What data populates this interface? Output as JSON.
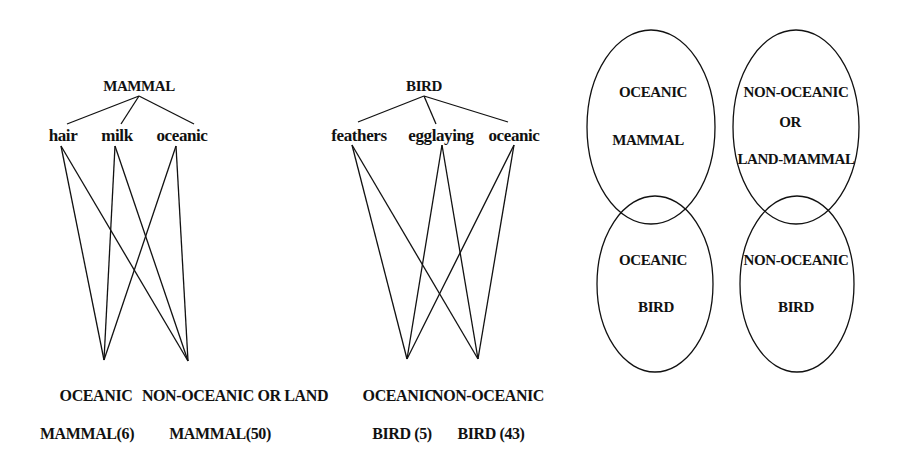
{
  "mammal_network": {
    "root": "MAMMAL",
    "features": [
      "hair",
      "milk",
      "oceanic"
    ],
    "outputs": [
      {
        "line1": "OCEANIC",
        "line2": "MAMMAL(6)"
      },
      {
        "line1": "NON-OCEANIC OR LAND",
        "line2": "MAMMAL(50)"
      }
    ]
  },
  "bird_network": {
    "root": "BIRD",
    "features": [
      "feathers",
      "egglaying",
      "oceanic"
    ],
    "outputs": [
      {
        "line1": "OCEANIC",
        "line2": "BIRD (5)"
      },
      {
        "line1": "NON-OCEANIC",
        "line2": "BIRD (43)"
      }
    ]
  },
  "venn": {
    "oceanic_mammal": [
      "OCEANIC",
      "MAMMAL"
    ],
    "non_oceanic_mammal": [
      "NON-OCEANIC",
      "OR",
      "LAND-MAMMAL"
    ],
    "oceanic_bird": [
      "OCEANIC",
      "BIRD"
    ],
    "non_oceanic_bird": [
      "NON-OCEANIC",
      "BIRD"
    ]
  },
  "colors": {
    "line": "#111111",
    "background": "#ffffff"
  }
}
